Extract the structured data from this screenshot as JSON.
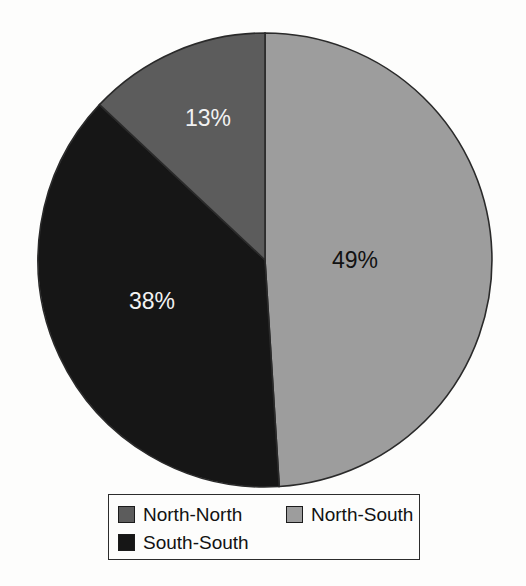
{
  "chart_data": {
    "type": "pie",
    "title": "",
    "labels": [
      "North-North",
      "North-South",
      "South-South"
    ],
    "values": [
      13,
      38,
      49
    ],
    "value_labels": [
      "13%",
      "38%",
      "49%"
    ],
    "units": "percent",
    "total": 100,
    "start_angle_deg": 0,
    "direction": "clockwise",
    "legend_position": "bottom",
    "grid": false,
    "slice_order_clockwise": [
      "North-South",
      "South-South",
      "North-North"
    ],
    "slices": [
      {
        "name": "North-South",
        "value": 49,
        "value_label": "49%",
        "color": "#9d9d9d",
        "label_color": "#121212",
        "start_deg": 0,
        "end_deg": 176.4,
        "label_x": 355,
        "label_y": 262
      },
      {
        "name": "South-South",
        "value": 38,
        "value_label": "38%",
        "color": "#161616",
        "label_color": "#f2f2f2",
        "start_deg": 176.4,
        "end_deg": 313.2,
        "label_x": 152,
        "label_y": 303
      },
      {
        "name": "North-North",
        "value": 13,
        "value_label": "13%",
        "color": "#5c5c5c",
        "label_color": "#f2f2f2",
        "start_deg": 313.2,
        "end_deg": 360,
        "label_x": 208,
        "label_y": 120
      }
    ],
    "outline_color": "#2a2a2a",
    "background_color": "#fdfdfc"
  },
  "pie": {
    "center_x": 265,
    "center_y": 260,
    "radius": 227
  },
  "legend": {
    "rows": [
      [
        {
          "label": "North-North",
          "color": "#5c5c5c"
        },
        {
          "label": "North-South",
          "color": "#9d9d9d"
        }
      ],
      [
        {
          "label": "South-South",
          "color": "#161616"
        }
      ]
    ]
  }
}
